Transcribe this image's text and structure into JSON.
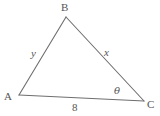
{
  "diagram": {
    "type": "triangle",
    "background_color": "#ffffff",
    "stroke_color": "#6e6e6e",
    "text_color": "#555555",
    "stroke_width": 1.1,
    "vertices": [
      {
        "name": "B",
        "label": "B",
        "x": 66,
        "y": 17,
        "label_x": 61,
        "label_y": 2
      },
      {
        "name": "A",
        "label": "A",
        "x": 19,
        "y": 95,
        "label_x": 4,
        "label_y": 91
      },
      {
        "name": "C",
        "label": "C",
        "x": 144,
        "y": 101,
        "label_x": 147,
        "label_y": 99
      }
    ],
    "edges": [
      {
        "name": "side-AB",
        "from": "A",
        "to": "B",
        "label": "y"
      },
      {
        "name": "side-BC",
        "from": "B",
        "to": "C",
        "label": "x"
      },
      {
        "name": "side-AC",
        "from": "A",
        "to": "C",
        "label": "8"
      }
    ],
    "side_labels": {
      "y": "y",
      "x": "x",
      "base": "8"
    },
    "angle_labels": {
      "at_C": "θ"
    }
  }
}
